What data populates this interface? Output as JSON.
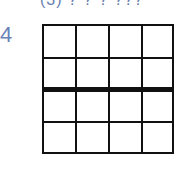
{
  "heading": {
    "text": "(3) ? ? ? ???"
  },
  "problem": {
    "number": "4"
  },
  "grid": {
    "rows": 4,
    "cols": 4,
    "thick_divider_after_row": 2,
    "line_color": "#111111"
  },
  "colors": {
    "number": "#6a84b8",
    "heading": "#6a7fb0"
  }
}
